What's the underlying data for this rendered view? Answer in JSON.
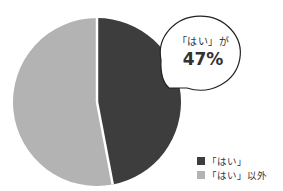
{
  "chart_data": {
    "type": "pie",
    "title": "",
    "slices": [
      {
        "label": "「はい」",
        "value": 47,
        "color": "#3d3d3d"
      },
      {
        "label": "「はい」以外",
        "value": 53,
        "color": "#b3b3b3"
      }
    ],
    "start_angle": "12 o'clock, clockwise",
    "annotation": {
      "line1": "「はい」が",
      "line2": "47%"
    },
    "legend": [
      "「はい」",
      "「はい」以外"
    ],
    "legend_position": "bottom-right"
  }
}
